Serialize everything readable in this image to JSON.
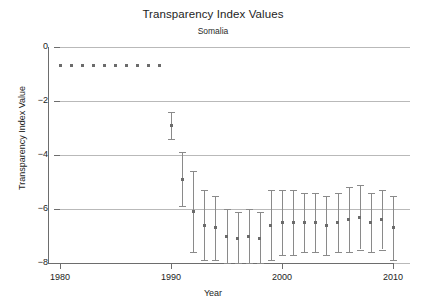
{
  "chart_data": {
    "type": "scatter",
    "title": "Transparency Index Values",
    "subtitle": "Somalia",
    "xlabel": "Year",
    "ylabel": "Transparency Index Value",
    "xlim": [
      1978.5,
      2011.5
    ],
    "ylim": [
      -8.6,
      0.6
    ],
    "xticks": [
      1980,
      1990,
      2000,
      2010
    ],
    "yticks": [
      0,
      -2,
      -4,
      -6,
      -8
    ],
    "grid": true,
    "legend": "none",
    "marker": "square",
    "marker_color": "#6b6b6b",
    "errorbar_color": "#8a8a8a",
    "x": [
      1980,
      1981,
      1982,
      1983,
      1984,
      1985,
      1986,
      1987,
      1988,
      1989,
      1990,
      1991,
      1992,
      1993,
      1994,
      1995,
      1996,
      1997,
      1998,
      1999,
      2000,
      2001,
      2002,
      2003,
      2004,
      2005,
      2006,
      2007,
      2008,
      2009,
      2010
    ],
    "values": [
      -0.7,
      -0.7,
      -0.7,
      -0.7,
      -0.7,
      -0.7,
      -0.7,
      -0.7,
      -0.7,
      -0.7,
      -2.9,
      -4.9,
      -6.1,
      -6.6,
      -6.7,
      -7.0,
      -7.1,
      -7.0,
      -7.1,
      -6.6,
      -6.5,
      -6.5,
      -6.5,
      -6.5,
      -6.6,
      -6.5,
      -6.4,
      -6.3,
      -6.5,
      -6.4,
      -6.7
    ],
    "err_low": [
      0,
      0,
      0,
      0,
      0,
      0,
      0,
      0,
      0,
      0,
      -3.4,
      -5.9,
      -7.6,
      -7.9,
      -7.9,
      -8.0,
      -8.0,
      -8.0,
      -8.0,
      -7.9,
      -7.7,
      -7.7,
      -7.6,
      -7.6,
      -7.7,
      -7.6,
      -7.6,
      -7.5,
      -7.6,
      -7.5,
      -7.9
    ],
    "err_high": [
      0,
      0,
      0,
      0,
      0,
      0,
      0,
      0,
      0,
      0,
      -2.4,
      -3.9,
      -4.6,
      -5.3,
      -5.5,
      -6.0,
      -6.1,
      -6.0,
      -6.1,
      -5.3,
      -5.3,
      -5.3,
      -5.4,
      -5.4,
      -5.5,
      -5.4,
      -5.2,
      -5.1,
      -5.4,
      -5.3,
      -5.5
    ],
    "has_errorbars": [
      false,
      false,
      false,
      false,
      false,
      false,
      false,
      false,
      false,
      false,
      true,
      true,
      true,
      true,
      true,
      true,
      true,
      true,
      true,
      true,
      true,
      true,
      true,
      true,
      true,
      true,
      true,
      true,
      true,
      true,
      true
    ]
  }
}
